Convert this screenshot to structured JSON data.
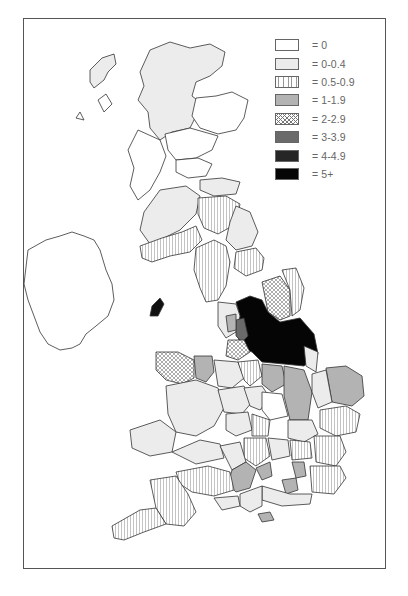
{
  "legend": {
    "items": [
      {
        "label": "= 0",
        "range": "0",
        "fill": "#ffffff",
        "pattern": "solid"
      },
      {
        "label": "= 0-0.4",
        "range": "0-0.4",
        "fill": "#ececec",
        "pattern": "solid"
      },
      {
        "label": "= 0.5-0.9",
        "range": "0.5-0.9",
        "fill": "#ffffff",
        "pattern": "vertical-lines"
      },
      {
        "label": "= 1-1.9",
        "range": "1-1.9",
        "fill": "#b3b3b3",
        "pattern": "solid"
      },
      {
        "label": "= 2-2.9",
        "range": "2-2.9",
        "fill": "#ffffff",
        "pattern": "crosshatch"
      },
      {
        "label": "= 3-3.9",
        "range": "3-3.9",
        "fill": "#6a6a6a",
        "pattern": "solid"
      },
      {
        "label": "= 4-4.9",
        "range": "4-4.9",
        "fill": "#262626",
        "pattern": "solid"
      },
      {
        "label": "= 5+",
        "range": "5+",
        "fill": "#050505",
        "pattern": "solid"
      }
    ]
  },
  "map": {
    "subject": "Great Britain and Ireland choropleth by county/region",
    "highlight_region": "Northern England (Yorkshire) = 5+"
  }
}
